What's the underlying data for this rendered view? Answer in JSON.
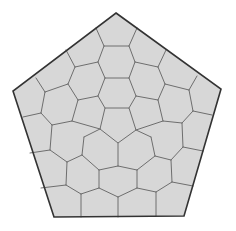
{
  "diagram": {
    "colors": {
      "background": "#ffffff",
      "cell_fill": "#d7d7d7",
      "cell_edge": "#6e6e6e",
      "outline": "#333333"
    },
    "outer_pentagon": [
      [
        116,
        13
      ],
      [
        221,
        89
      ],
      [
        184,
        216
      ],
      [
        54,
        217
      ],
      [
        13,
        91
      ]
    ],
    "center_pentagon": [
      [
        105,
        108
      ],
      [
        129,
        108
      ],
      [
        136,
        130
      ],
      [
        118,
        143
      ],
      [
        100,
        129
      ]
    ],
    "edges": [
      [
        [
          96,
          28
        ],
        [
          104,
          46
        ]
      ],
      [
        [
          137,
          28
        ],
        [
          129,
          46
        ]
      ],
      [
        [
          104,
          46
        ],
        [
          129,
          46
        ]
      ],
      [
        [
          104,
          46
        ],
        [
          98,
          62
        ]
      ],
      [
        [
          129,
          46
        ],
        [
          135,
          62
        ]
      ],
      [
        [
          66,
          50
        ],
        [
          75,
          67
        ]
      ],
      [
        [
          166,
          50
        ],
        [
          158,
          67
        ]
      ],
      [
        [
          75,
          67
        ],
        [
          98,
          62
        ]
      ],
      [
        [
          135,
          62
        ],
        [
          158,
          67
        ]
      ],
      [
        [
          98,
          62
        ],
        [
          105,
          78
        ]
      ],
      [
        [
          135,
          62
        ],
        [
          129,
          78
        ]
      ],
      [
        [
          105,
          78
        ],
        [
          129,
          78
        ]
      ],
      [
        [
          75,
          67
        ],
        [
          68,
          84
        ]
      ],
      [
        [
          158,
          67
        ],
        [
          165,
          84
        ]
      ],
      [
        [
          36,
          78
        ],
        [
          45,
          92
        ]
      ],
      [
        [
          197,
          76
        ],
        [
          189,
          90
        ]
      ],
      [
        [
          45,
          92
        ],
        [
          68,
          84
        ]
      ],
      [
        [
          165,
          84
        ],
        [
          189,
          90
        ]
      ],
      [
        [
          68,
          84
        ],
        [
          78,
          100
        ]
      ],
      [
        [
          165,
          84
        ],
        [
          158,
          100
        ]
      ],
      [
        [
          105,
          78
        ],
        [
          98,
          96
        ]
      ],
      [
        [
          129,
          78
        ],
        [
          136,
          96
        ]
      ],
      [
        [
          78,
          100
        ],
        [
          98,
          96
        ]
      ],
      [
        [
          136,
          96
        ],
        [
          158,
          100
        ]
      ],
      [
        [
          98,
          96
        ],
        [
          105,
          108
        ]
      ],
      [
        [
          136,
          96
        ],
        [
          129,
          108
        ]
      ],
      [
        [
          45,
          92
        ],
        [
          41,
          113
        ]
      ],
      [
        [
          189,
          90
        ],
        [
          193,
          111
        ]
      ],
      [
        [
          23,
          117
        ],
        [
          41,
          113
        ]
      ],
      [
        [
          193,
          111
        ],
        [
          212,
          115
        ]
      ],
      [
        [
          41,
          113
        ],
        [
          52,
          125
        ]
      ],
      [
        [
          193,
          111
        ],
        [
          182,
          123
        ]
      ],
      [
        [
          78,
          100
        ],
        [
          72,
          121
        ]
      ],
      [
        [
          158,
          100
        ],
        [
          163,
          121
        ]
      ],
      [
        [
          52,
          125
        ],
        [
          72,
          121
        ]
      ],
      [
        [
          163,
          121
        ],
        [
          182,
          123
        ]
      ],
      [
        [
          72,
          121
        ],
        [
          100,
          129
        ]
      ],
      [
        [
          163,
          121
        ],
        [
          136,
          130
        ]
      ],
      [
        [
          52,
          125
        ],
        [
          50,
          150
        ]
      ],
      [
        [
          182,
          123
        ],
        [
          183,
          147
        ]
      ],
      [
        [
          30,
          153
        ],
        [
          50,
          150
        ]
      ],
      [
        [
          183,
          147
        ],
        [
          203,
          151
        ]
      ],
      [
        [
          50,
          150
        ],
        [
          67,
          162
        ]
      ],
      [
        [
          183,
          147
        ],
        [
          171,
          160
        ]
      ],
      [
        [
          100,
          129
        ],
        [
          84,
          137
        ]
      ],
      [
        [
          136,
          130
        ],
        [
          151,
          137
        ]
      ],
      [
        [
          84,
          137
        ],
        [
          82,
          155
        ]
      ],
      [
        [
          151,
          137
        ],
        [
          155,
          156
        ]
      ],
      [
        [
          82,
          155
        ],
        [
          67,
          162
        ]
      ],
      [
        [
          155,
          156
        ],
        [
          171,
          160
        ]
      ],
      [
        [
          118,
          143
        ],
        [
          118,
          166
        ]
      ],
      [
        [
          82,
          155
        ],
        [
          99,
          170
        ]
      ],
      [
        [
          155,
          156
        ],
        [
          137,
          170
        ]
      ],
      [
        [
          99,
          170
        ],
        [
          118,
          166
        ]
      ],
      [
        [
          118,
          166
        ],
        [
          137,
          170
        ]
      ],
      [
        [
          67,
          162
        ],
        [
          66,
          185
        ]
      ],
      [
        [
          171,
          160
        ],
        [
          172,
          182
        ]
      ],
      [
        [
          41,
          188
        ],
        [
          66,
          185
        ]
      ],
      [
        [
          172,
          182
        ],
        [
          193,
          186
        ]
      ],
      [
        [
          66,
          185
        ],
        [
          81,
          194
        ]
      ],
      [
        [
          172,
          182
        ],
        [
          156,
          192
        ]
      ],
      [
        [
          99,
          170
        ],
        [
          99,
          188
        ]
      ],
      [
        [
          137,
          170
        ],
        [
          137,
          188
        ]
      ],
      [
        [
          81,
          194
        ],
        [
          99,
          188
        ]
      ],
      [
        [
          137,
          188
        ],
        [
          156,
          192
        ]
      ],
      [
        [
          99,
          188
        ],
        [
          118,
          197
        ]
      ],
      [
        [
          118,
          197
        ],
        [
          137,
          188
        ]
      ],
      [
        [
          81,
          194
        ],
        [
          81,
          217
        ]
      ],
      [
        [
          118,
          197
        ],
        [
          118,
          217
        ]
      ],
      [
        [
          156,
          192
        ],
        [
          156,
          216
        ]
      ]
    ]
  }
}
